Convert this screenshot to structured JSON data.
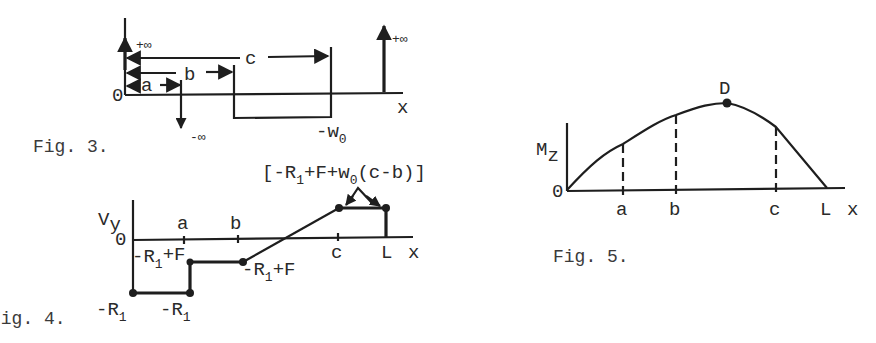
{
  "figures": {
    "fig3": {
      "caption": "Fig. 3.",
      "title": "Load intensity diagram",
      "origin_label": "0",
      "x_label": "x",
      "dims": {
        "a": "a",
        "b": "b",
        "c": "c"
      },
      "plus_inf_left": "+∞",
      "minus_inf": "-∞",
      "plus_inf_right": "+∞",
      "w0_label": "-w",
      "w0_sub": "0"
    },
    "fig4": {
      "caption": "Fig. 4.",
      "title": "Shear force diagram",
      "y_label": "V",
      "y_sub": "y",
      "origin_label": "0",
      "x_label": "x",
      "ticks": {
        "a": "a",
        "b": "b",
        "c": "c",
        "L": "L"
      },
      "bracket_label": {
        "open": "[",
        "p1": "-R",
        "p1_sub": "1",
        "p2": "+F+w",
        "p2_sub": "0",
        "p3": "(c-b)",
        "close": "]"
      },
      "neg_r1_left": {
        "text": "-R",
        "sub": "1"
      },
      "neg_r1_at_a": {
        "text": "-R",
        "sub": "1"
      },
      "r1_plus_f_a": {
        "text": "-R",
        "sub": "1",
        "rest": "+F"
      },
      "r1_plus_f_b": {
        "text": "-R",
        "sub": "1",
        "rest": "+F"
      }
    },
    "fig5": {
      "caption": "Fig. 5.",
      "title": "Bending moment diagram",
      "y_label": "M",
      "y_sub": "z",
      "origin_label": "0",
      "x_label": "x",
      "ticks": {
        "a": "a",
        "b": "b",
        "c": "c",
        "L": "L"
      },
      "peak_label": "D"
    }
  },
  "colors": {
    "ink": "#1e1e1e",
    "background": "#ffffff"
  }
}
